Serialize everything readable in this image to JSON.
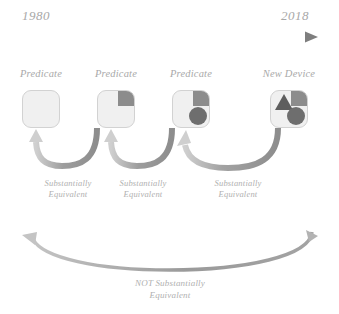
{
  "timeline": {
    "start_year": "1980",
    "end_year": "2018",
    "arrow_icon": "right-arrow-icon",
    "line_color": "#8f8f8f"
  },
  "devices": [
    {
      "label": "Predicate",
      "shapes": [],
      "box_color": "#f0f0f0",
      "border_color": "#d2d2d2"
    },
    {
      "label": "Predicate",
      "shapes": [
        "square"
      ],
      "box_color": "#f0f0f0",
      "border_color": "#d2d2d2"
    },
    {
      "label": "Predicate",
      "shapes": [
        "square",
        "circle"
      ],
      "box_color": "#f0f0f0",
      "border_color": "#d2d2d2"
    },
    {
      "label": "New Device",
      "shapes": [
        "triangle",
        "square",
        "circle"
      ],
      "box_color": "#f0f0f0",
      "border_color": "#d2d2d2"
    }
  ],
  "shape_colors": {
    "square": "#8c8c8c",
    "circle": "#6e6e6e",
    "triangle": "#5e5e5e"
  },
  "equivalence_arrows": [
    {
      "icon": "curved-left-arrow-icon",
      "label_line1": "Substantially",
      "label_line2": "Equivalent",
      "from_device": "Predicate",
      "to_device": "Predicate"
    },
    {
      "icon": "curved-left-arrow-icon",
      "label_line1": "Substantially",
      "label_line2": "Equivalent",
      "from_device": "Predicate",
      "to_device": "Predicate"
    },
    {
      "icon": "curved-left-arrow-icon",
      "label_line1": "Substantially",
      "label_line2": "Equivalent",
      "from_device": "New Device",
      "to_device": "Predicate"
    }
  ],
  "not_equivalent_arrow": {
    "icon": "curved-left-arrow-icon",
    "label_line1": "NOT Substantially",
    "label_line2": "Equivalent",
    "from_device": "New Device",
    "to_device": "Predicate",
    "arrow_color": "#9b9b9b"
  }
}
